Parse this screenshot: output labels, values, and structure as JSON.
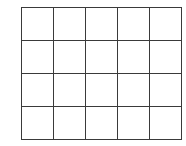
{
  "grid": {
    "rows": 4,
    "columns": 5,
    "line_color": "#3a3a3a",
    "cell_fill": "#ffffff",
    "cells": [
      [
        "",
        "",
        "",
        "",
        ""
      ],
      [
        "",
        "",
        "",
        "",
        ""
      ],
      [
        "",
        "",
        "",
        "",
        ""
      ],
      [
        "",
        "",
        "",
        "",
        ""
      ]
    ]
  }
}
